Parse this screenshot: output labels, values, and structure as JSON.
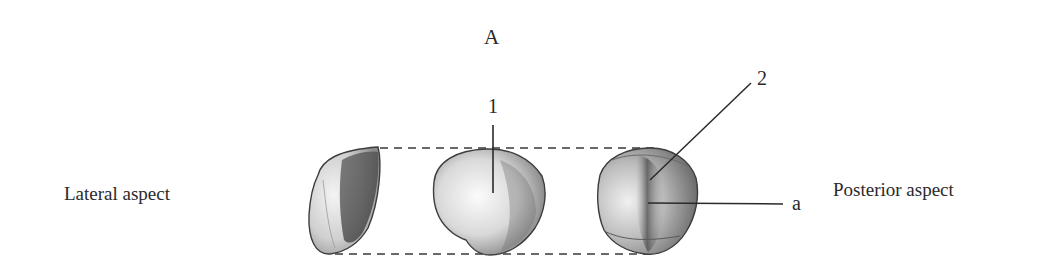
{
  "figure": {
    "panel_letter": "A",
    "left_caption": "Lateral aspect",
    "right_caption": "Posterior aspect",
    "callouts": [
      {
        "id": "1",
        "label": "1"
      },
      {
        "id": "2",
        "label": "2"
      },
      {
        "id": "a",
        "label": "a"
      }
    ],
    "views": [
      {
        "name": "lateral-view"
      },
      {
        "name": "anterior-view"
      },
      {
        "name": "posterior-view"
      }
    ],
    "colors": {
      "ink": "#2a2a2a",
      "shade_dark": "#555555",
      "shade_light": "#d8d8d8",
      "background": "#ffffff"
    }
  }
}
